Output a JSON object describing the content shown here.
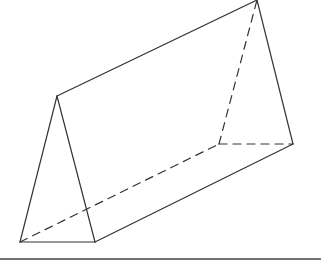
{
  "diagram": {
    "type": "triangular-prism",
    "stroke_color": "#333333",
    "ground_color": "#444444",
    "vertices": {
      "A": [
        20,
        242
      ],
      "B": [
        95,
        242
      ],
      "C": [
        57,
        96
      ],
      "D": [
        219,
        144
      ],
      "E": [
        293,
        144
      ],
      "F": [
        257,
        0
      ]
    },
    "solid_edges": [
      [
        "A",
        "B"
      ],
      [
        "A",
        "C"
      ],
      [
        "B",
        "C"
      ],
      [
        "C",
        "F"
      ],
      [
        "F",
        "E"
      ],
      [
        "B",
        "E"
      ]
    ],
    "dashed_edges": [
      [
        "A",
        "D"
      ],
      [
        "D",
        "E"
      ],
      [
        "D",
        "F"
      ]
    ],
    "ground_line": {
      "x1": 0,
      "y1": 259,
      "x2": 321,
      "y2": 259
    }
  }
}
